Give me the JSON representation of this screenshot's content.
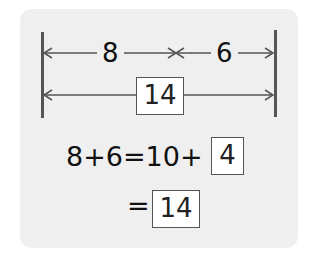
{
  "diagram": {
    "bar_top": {
      "left_segment": "8",
      "right_segment": "6"
    },
    "bar_total": {
      "answer_box": "14"
    }
  },
  "equation": {
    "line1_prefix": "8+6=10+",
    "line1_box": "4",
    "line2_prefix": "=",
    "line2_box": "14"
  },
  "colors": {
    "panel": "#efefef",
    "line": "#555555",
    "text": "#111111"
  }
}
